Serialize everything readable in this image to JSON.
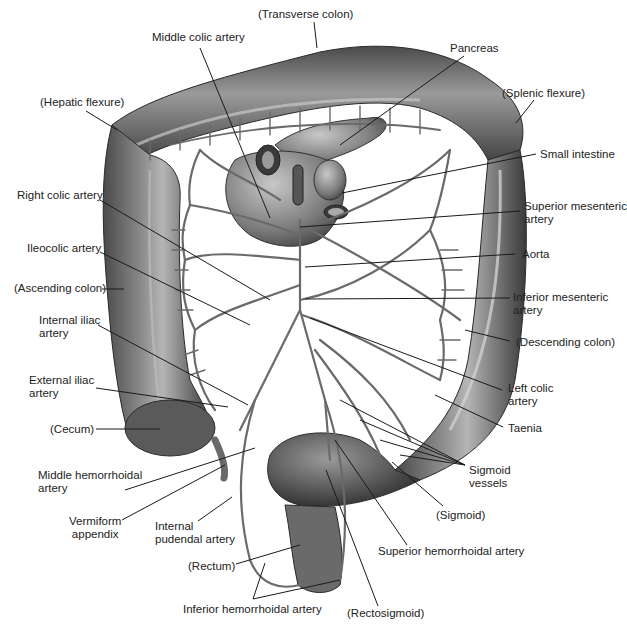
{
  "figure": {
    "colors": {
      "background": "#ffffff",
      "colon_dark": "#3a3a3a",
      "colon_mid": "#6e6e6e",
      "colon_light": "#a8a8a8",
      "vessel": "#6a6a6a",
      "leader_line": "#1a1a1a",
      "label_text": "#222222"
    }
  },
  "labels": [
    {
      "id": "transverse-colon",
      "text": "(Transverse colon)",
      "x": 258,
      "y": 8,
      "align": "left",
      "line": [
        [
          314,
          22
        ],
        [
          317,
          48
        ]
      ]
    },
    {
      "id": "middle-colic-artery",
      "text": "Middle colic artery",
      "x": 152,
      "y": 31,
      "align": "left",
      "line": [
        [
          200,
          48
        ],
        [
          270,
          218
        ]
      ]
    },
    {
      "id": "pancreas",
      "text": "Pancreas",
      "x": 450,
      "y": 42,
      "align": "left",
      "line": [
        [
          464,
          56
        ],
        [
          340,
          145
        ]
      ]
    },
    {
      "id": "hepatic-flexure",
      "text": "(Hepatic flexure)",
      "x": 40,
      "y": 96,
      "align": "left",
      "line": [
        [
          86,
          111
        ],
        [
          117,
          130
        ]
      ]
    },
    {
      "id": "splenic-flexure",
      "text": "(Splenic flexure)",
      "x": 502,
      "y": 87,
      "align": "left",
      "line": [
        [
          534,
          100
        ],
        [
          516,
          123
        ]
      ]
    },
    {
      "id": "small-intestine",
      "text": "Small intestine",
      "x": 540,
      "y": 148,
      "align": "left",
      "line": [
        [
          536,
          154
        ],
        [
          342,
          193
        ]
      ]
    },
    {
      "id": "right-colic-artery",
      "text": "Right colic artery",
      "x": 17,
      "y": 189,
      "align": "left",
      "line": [
        [
          100,
          200
        ],
        [
          270,
          300
        ]
      ]
    },
    {
      "id": "superior-mesenteric-artery",
      "text": "Superior mesenteric\nartery",
      "x": 524,
      "y": 200,
      "align": "left",
      "line": [
        [
          520,
          211
        ],
        [
          300,
          227
        ]
      ]
    },
    {
      "id": "ileocolic-artery",
      "text": "Ileocolic artery",
      "x": 27,
      "y": 242,
      "align": "left",
      "line": [
        [
          100,
          252
        ],
        [
          250,
          325
        ]
      ]
    },
    {
      "id": "aorta",
      "text": "Aorta",
      "x": 522,
      "y": 248,
      "align": "left",
      "line": [
        [
          515,
          254
        ],
        [
          305,
          267
        ]
      ]
    },
    {
      "id": "ascending-colon",
      "text": "(Ascending colon)",
      "x": 14,
      "y": 282,
      "align": "left",
      "line": [
        [
          102,
          289
        ],
        [
          124,
          289
        ]
      ]
    },
    {
      "id": "inferior-mesenteric-artery",
      "text": "Inferior mesenteric\nartery",
      "x": 513,
      "y": 291,
      "align": "left",
      "line": [
        [
          510,
          298
        ],
        [
          305,
          299
        ]
      ]
    },
    {
      "id": "internal-iliac-artery",
      "text": "Internal iliac\nartery",
      "x": 39,
      "y": 314,
      "align": "left",
      "line": [
        [
          98,
          325
        ],
        [
          248,
          405
        ]
      ]
    },
    {
      "id": "descending-colon",
      "text": "(Descending colon)",
      "x": 516,
      "y": 336,
      "align": "left",
      "line": [
        [
          510,
          341
        ],
        [
          465,
          330
        ]
      ]
    },
    {
      "id": "external-iliac-artery",
      "text": "External iliac\nartery",
      "x": 29,
      "y": 374,
      "align": "left",
      "line": [
        [
          96,
          388
        ],
        [
          228,
          407
        ]
      ]
    },
    {
      "id": "left-colic-artery",
      "text": "Left colic\nartery",
      "x": 508,
      "y": 382,
      "align": "left",
      "line": [
        [
          502,
          390
        ],
        [
          310,
          318
        ]
      ]
    },
    {
      "id": "cecum",
      "text": "(Cecum)",
      "x": 50,
      "y": 423,
      "align": "left",
      "line": [
        [
          96,
          429
        ],
        [
          160,
          429
        ]
      ]
    },
    {
      "id": "taenia",
      "text": "Taenia",
      "x": 508,
      "y": 422,
      "align": "left",
      "line": [
        [
          503,
          427
        ],
        [
          435,
          395
        ]
      ]
    },
    {
      "id": "middle-hemorrhoidal-artery",
      "text": "Middle hemorrhoidal\nartery",
      "x": 38,
      "y": 469,
      "align": "left",
      "line": [
        [
          125,
          490
        ],
        [
          255,
          448
        ]
      ]
    },
    {
      "id": "sigmoid-vessels",
      "text": "Sigmoid\nvessels",
      "x": 469,
      "y": 464,
      "align": "left",
      "lines": [
        [
          [
            465,
            465
          ],
          [
            340,
            400
          ]
        ],
        [
          [
            465,
            465
          ],
          [
            360,
            420
          ]
        ],
        [
          [
            465,
            465
          ],
          [
            380,
            440
          ]
        ],
        [
          [
            465,
            465
          ],
          [
            400,
            455
          ]
        ]
      ]
    },
    {
      "id": "sigmoid",
      "text": "(Sigmoid)",
      "x": 436,
      "y": 509,
      "align": "left",
      "line": [
        [
          443,
          506
        ],
        [
          392,
          462
        ]
      ]
    },
    {
      "id": "vermiform-appendix",
      "text": "Vermiform\nappendix",
      "x": 69,
      "y": 515,
      "align": "center",
      "line": [
        [
          122,
          520
        ],
        [
          225,
          465
        ]
      ]
    },
    {
      "id": "internal-pudendal-artery",
      "text": "Internal\npudendal artery",
      "x": 155,
      "y": 520,
      "align": "left",
      "line": [
        [
          198,
          521
        ],
        [
          232,
          497
        ]
      ]
    },
    {
      "id": "superior-hemorrhoidal-artery",
      "text": "Superior hemorrhoidal artery",
      "x": 378,
      "y": 545,
      "align": "left",
      "line": [
        [
          407,
          545
        ],
        [
          335,
          440
        ]
      ]
    },
    {
      "id": "rectum",
      "text": "(Rectum)",
      "x": 188,
      "y": 560,
      "align": "left",
      "line": [
        [
          236,
          564
        ],
        [
          300,
          545
        ]
      ]
    },
    {
      "id": "inferior-hemorrhoidal-artery",
      "text": "Inferior hemorrhoidal artery",
      "x": 183,
      "y": 603,
      "align": "left",
      "lines": [
        [
          [
            253,
            599
          ],
          [
            265,
            563
          ]
        ],
        [
          [
            253,
            599
          ],
          [
            340,
            580
          ]
        ]
      ]
    },
    {
      "id": "rectosigmoid",
      "text": "(Rectosigmoid)",
      "x": 347,
      "y": 607,
      "align": "left",
      "line": [
        [
          378,
          606
        ],
        [
          326,
          470
        ]
      ]
    }
  ]
}
